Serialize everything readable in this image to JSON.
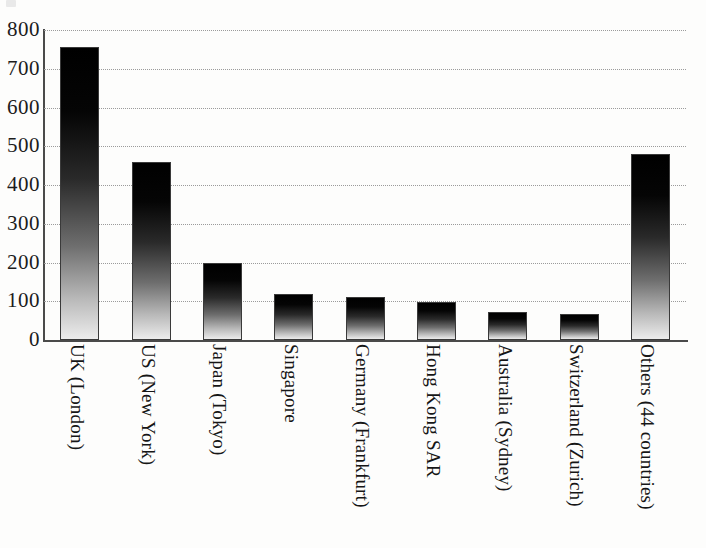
{
  "chart_data": {
    "type": "bar",
    "title": "",
    "subtitle": "",
    "xlabel": "",
    "ylabel": "",
    "ylim": [
      0,
      800
    ],
    "ytick_values": [
      800,
      700,
      600,
      500,
      400,
      300,
      200,
      100,
      0
    ],
    "ytick_labels": [
      "800",
      "700",
      "600",
      "500",
      "400",
      "300",
      "200",
      "100",
      "0"
    ],
    "grid": true,
    "grid_style": "dotted-horizontal",
    "legend": false,
    "legend_position": "none",
    "bar_fill": "vertical-gradient-black-to-white",
    "bar_edge_color": "#3a3a3a",
    "categories": [
      "UK (London)",
      "US (New York)",
      "Japan (Tokyo)",
      "Singapore",
      "Germany (Frankfurt)",
      "Hong Kong SAR",
      "Australia (Sydney)",
      "Switzerland (Zurich)",
      "Others (44 countries)"
    ],
    "values": [
      755,
      460,
      198,
      118,
      112,
      97,
      72,
      68,
      480
    ]
  },
  "axis": {
    "y_axis_color": "#4a4a4a",
    "x_axis_color": "#4a4a4a",
    "gridline_color": "#9b9b9b"
  },
  "artifacts": {
    "top_left_mark": ""
  }
}
